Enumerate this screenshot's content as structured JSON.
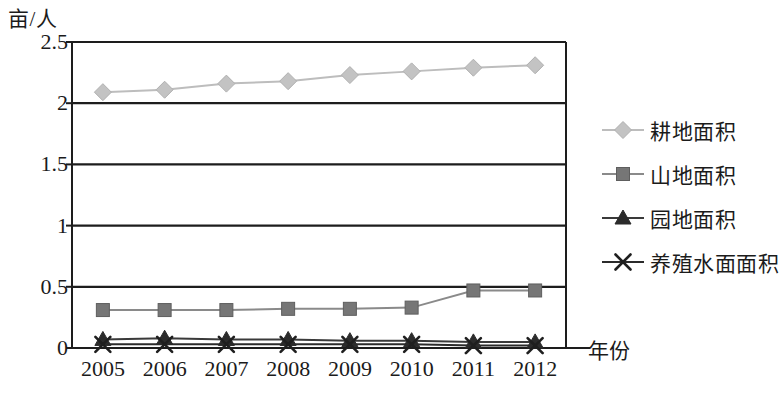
{
  "chart_data": {
    "type": "line",
    "title": "",
    "ylabel": "亩/人",
    "xlabel": "年份",
    "categories": [
      "2005",
      "2006",
      "2007",
      "2008",
      "2009",
      "2010",
      "2011",
      "2012"
    ],
    "ylim": [
      0,
      2.5
    ],
    "yticks": [
      "0",
      "0.5",
      "1",
      "1.5",
      "2",
      "2.5"
    ],
    "ytick_values": [
      0,
      0.5,
      1,
      1.5,
      2,
      2.5
    ],
    "grid": true,
    "legend_position": "right",
    "series": [
      {
        "name": "耕地面积",
        "marker": "diamond",
        "color": "#c3c3c3",
        "line_color": "#bdbdbd",
        "values": [
          2.09,
          2.11,
          2.16,
          2.18,
          2.23,
          2.26,
          2.29,
          2.31
        ]
      },
      {
        "name": "山地面积",
        "marker": "square",
        "color": "#767676",
        "line_color": "#8a8a8a",
        "values": [
          0.31,
          0.31,
          0.31,
          0.32,
          0.32,
          0.33,
          0.47,
          0.47
        ]
      },
      {
        "name": "园地面积",
        "marker": "triangle",
        "color": "#2b2b2b",
        "line_color": "#3a3a3a",
        "values": [
          0.07,
          0.08,
          0.07,
          0.07,
          0.06,
          0.06,
          0.05,
          0.05
        ]
      },
      {
        "name": "养殖水面面积",
        "marker": "x",
        "color": "#1f1f1f",
        "line_color": "#2b2b2b",
        "values": [
          0.03,
          0.03,
          0.03,
          0.03,
          0.03,
          0.03,
          0.02,
          0.02
        ]
      }
    ]
  },
  "legend": {
    "items": [
      {
        "label": "耕地面积",
        "marker": "diamond-marker-icon"
      },
      {
        "label": "山地面积",
        "marker": "square-marker-icon"
      },
      {
        "label": "园地面积",
        "marker": "triangle-marker-icon"
      },
      {
        "label": "养殖水面面积",
        "marker": "x-marker-icon"
      }
    ]
  }
}
